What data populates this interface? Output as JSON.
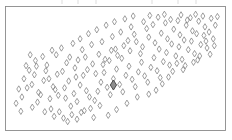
{
  "figure": {
    "background_color": "#ffffff",
    "width": 232,
    "height": 140
  },
  "axes": {
    "frame_color": "#8a8a8a",
    "frame_line_width": 0.9,
    "frame": {
      "x": 5.5,
      "y": 6.5,
      "width": 220,
      "height": 124
    },
    "grid": "off",
    "tick_labels_visible": false,
    "axis_labels_visible": false,
    "title_visible": false,
    "top_edge_artifacts": "faint clipped tick marks above top border"
  },
  "marker_style": {
    "shape": "diamond",
    "fill": "none",
    "stroke_color": "#7d7d7d",
    "stroke_width": 0.75,
    "size": 3.2,
    "highlight_stroke_color": "#4a4a4a",
    "highlight_fill_color": "#8e8e8e",
    "highlight_size": 5.0
  },
  "chart_data": {
    "type": "scatter",
    "title": "",
    "xlabel": "",
    "ylabel": "",
    "xlim": [
      0,
      100
    ],
    "ylim": [
      0,
      100
    ],
    "grid": false,
    "legend": null,
    "series": [
      {
        "name": "observations",
        "n_points": 172,
        "correlation": "positive",
        "points": [
          [
            13.0,
            29.0
          ],
          [
            2.2,
            19.5
          ],
          [
            9.8,
            36.0
          ],
          [
            16.5,
            48.0
          ],
          [
            21.0,
            31.5
          ],
          [
            24.5,
            47.5
          ],
          [
            26.0,
            24.0
          ],
          [
            28.5,
            17.0
          ],
          [
            12.5,
            20.5
          ],
          [
            18.5,
            23.5
          ],
          [
            20.0,
            34.0
          ],
          [
            22.5,
            26.5
          ],
          [
            25.5,
            33.0
          ],
          [
            27.5,
            39.0
          ],
          [
            30.0,
            28.0
          ],
          [
            31.5,
            21.0
          ],
          [
            33.0,
            35.5
          ],
          [
            34.5,
            44.0
          ],
          [
            36.0,
            30.5
          ],
          [
            37.5,
            25.0
          ],
          [
            19.0,
            14.5
          ],
          [
            23.0,
            12.0
          ],
          [
            29.0,
            9.5
          ],
          [
            33.5,
            11.5
          ],
          [
            38.0,
            15.0
          ],
          [
            40.0,
            22.0
          ],
          [
            41.5,
            30.0
          ],
          [
            43.0,
            38.0
          ],
          [
            44.5,
            46.5
          ],
          [
            46.0,
            33.5
          ],
          [
            47.5,
            27.0
          ],
          [
            49.0,
            41.0
          ],
          [
            50.5,
            49.5
          ],
          [
            52.0,
            36.0
          ],
          [
            53.5,
            29.5
          ],
          [
            55.0,
            44.0
          ],
          [
            56.5,
            52.0
          ],
          [
            58.0,
            40.5
          ],
          [
            59.5,
            34.0
          ],
          [
            61.0,
            47.0
          ],
          [
            62.5,
            55.5
          ],
          [
            64.0,
            43.5
          ],
          [
            65.5,
            38.0
          ],
          [
            67.0,
            51.0
          ],
          [
            68.5,
            59.5
          ],
          [
            70.0,
            48.0
          ],
          [
            71.5,
            42.0
          ],
          [
            73.0,
            56.0
          ],
          [
            74.5,
            64.0
          ],
          [
            76.0,
            53.0
          ],
          [
            77.5,
            47.5
          ],
          [
            79.0,
            61.0
          ],
          [
            80.5,
            69.0
          ],
          [
            82.0,
            58.0
          ],
          [
            83.5,
            52.5
          ],
          [
            85.0,
            66.5
          ],
          [
            86.5,
            74.0
          ],
          [
            88.0,
            63.0
          ],
          [
            89.5,
            57.5
          ],
          [
            91.0,
            71.0
          ],
          [
            92.5,
            79.0
          ],
          [
            94.0,
            68.0
          ],
          [
            95.5,
            62.5
          ],
          [
            97.0,
            76.0
          ],
          [
            11.0,
            44.5
          ],
          [
            15.5,
            39.5
          ],
          [
            17.0,
            53.0
          ],
          [
            30.5,
            50.5
          ],
          [
            32.0,
            57.5
          ],
          [
            35.5,
            60.0
          ],
          [
            39.0,
            54.0
          ],
          [
            42.0,
            62.5
          ],
          [
            45.0,
            58.0
          ],
          [
            48.0,
            66.0
          ],
          [
            51.0,
            61.5
          ],
          [
            54.0,
            70.0
          ],
          [
            57.0,
            65.5
          ],
          [
            60.0,
            73.5
          ],
          [
            63.0,
            69.0
          ],
          [
            66.0,
            77.5
          ],
          [
            69.0,
            72.5
          ],
          [
            72.0,
            81.0
          ],
          [
            75.0,
            76.0
          ],
          [
            78.0,
            84.5
          ],
          [
            81.0,
            79.5
          ],
          [
            84.0,
            88.0
          ],
          [
            87.0,
            83.0
          ],
          [
            90.0,
            91.5
          ],
          [
            93.0,
            86.5
          ],
          [
            96.0,
            94.0
          ],
          [
            5.0,
            25.0
          ],
          [
            7.5,
            33.0
          ],
          [
            10.0,
            16.0
          ],
          [
            14.0,
            27.0
          ],
          [
            6.0,
            41.0
          ],
          [
            8.5,
            48.5
          ],
          [
            12.0,
            52.0
          ],
          [
            16.0,
            12.0
          ],
          [
            20.5,
            8.0
          ],
          [
            25.0,
            6.5
          ],
          [
            3.5,
            32.0
          ],
          [
            4.5,
            12.5
          ],
          [
            18.0,
            41.0
          ],
          [
            22.0,
            45.0
          ],
          [
            26.5,
            55.0
          ],
          [
            31.0,
            42.5
          ],
          [
            36.5,
            49.0
          ],
          [
            40.5,
            45.5
          ],
          [
            44.0,
            53.5
          ],
          [
            47.0,
            57.0
          ],
          [
            50.0,
            67.0
          ],
          [
            53.0,
            59.0
          ],
          [
            56.0,
            74.5
          ],
          [
            59.0,
            80.0
          ],
          [
            62.0,
            63.0
          ],
          [
            65.0,
            85.0
          ],
          [
            68.0,
            88.5
          ],
          [
            71.0,
            67.0
          ],
          [
            74.0,
            90.0
          ],
          [
            77.0,
            71.5
          ],
          [
            80.0,
            92.0
          ],
          [
            83.0,
            75.0
          ],
          [
            86.0,
            94.5
          ],
          [
            89.0,
            80.5
          ],
          [
            92.0,
            96.0
          ],
          [
            28.0,
            60.0
          ],
          [
            34.0,
            66.5
          ],
          [
            38.5,
            71.0
          ],
          [
            43.5,
            73.5
          ],
          [
            48.5,
            78.0
          ],
          [
            52.5,
            82.0
          ],
          [
            57.5,
            86.5
          ],
          [
            21.5,
            62.0
          ],
          [
            24.0,
            68.0
          ],
          [
            29.5,
            72.0
          ],
          [
            15.0,
            60.5
          ],
          [
            19.5,
            66.0
          ],
          [
            11.5,
            57.0
          ],
          [
            7.0,
            52.5
          ],
          [
            9.0,
            62.0
          ],
          [
            33.0,
            76.0
          ],
          [
            37.0,
            80.5
          ],
          [
            41.0,
            84.0
          ],
          [
            45.5,
            88.0
          ],
          [
            49.5,
            91.0
          ],
          [
            54.5,
            93.5
          ],
          [
            58.5,
            96.0
          ],
          [
            63.5,
            91.0
          ],
          [
            66.5,
            96.5
          ],
          [
            70.5,
            95.0
          ],
          [
            73.5,
            97.5
          ],
          [
            76.5,
            93.0
          ],
          [
            81.5,
            97.0
          ],
          [
            84.5,
            92.5
          ],
          [
            88.5,
            97.5
          ],
          [
            95.0,
            82.0
          ],
          [
            98.0,
            88.0
          ],
          [
            99.0,
            95.5
          ],
          [
            97.5,
            70.0
          ],
          [
            93.5,
            74.0
          ],
          [
            90.5,
            61.0
          ],
          [
            87.5,
            55.5
          ],
          [
            82.5,
            49.0
          ],
          [
            79.5,
            54.5
          ],
          [
            75.5,
            42.5
          ],
          [
            72.5,
            36.5
          ],
          [
            69.5,
            31.0
          ],
          [
            66.0,
            27.5
          ],
          [
            60.5,
            25.0
          ],
          [
            55.5,
            19.5
          ],
          [
            50.5,
            14.0
          ],
          [
            46.5,
            9.0
          ],
          [
            42.5,
            17.5
          ],
          [
            39.5,
            7.0
          ],
          [
            35.0,
            13.0
          ],
          [
            31.5,
            5.5
          ],
          [
            27.0,
            3.5
          ]
        ],
        "highlighted_point": {
          "x": 49.0,
          "y": 35.5,
          "label": ""
        }
      }
    ]
  }
}
